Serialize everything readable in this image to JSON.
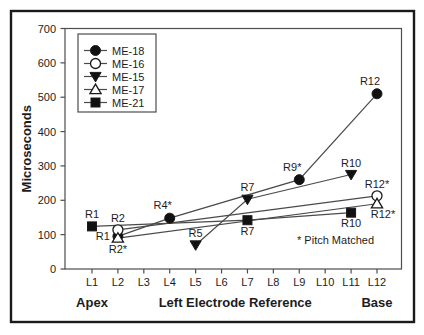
{
  "figure": {
    "background": "#ffffff",
    "frame_color": "#1a1a1a",
    "axis_color": "#4d4d4d",
    "line_color": "#4a4a4a",
    "marker_fill": "#111111",
    "marker_stroke": "#1a1a1a",
    "text_color": "#1c1c1c"
  },
  "chart_data": {
    "type": "line",
    "title": "",
    "xlabel": "Left Electrode Reference",
    "ylabel": "Microseconds",
    "x_axis": {
      "tick_labels": [
        "L1",
        "L2",
        "L3",
        "L4",
        "L5",
        "L6",
        "L7",
        "L8",
        "L9",
        "L10",
        "L11",
        "L12"
      ],
      "left_caption": "Apex",
      "right_caption": "Base"
    },
    "y_axis": {
      "min": 0,
      "max": 700,
      "tick_step": 100,
      "tick_labels": [
        "0",
        "100",
        "200",
        "300",
        "400",
        "500",
        "600",
        "700"
      ]
    },
    "legend": {
      "position": "top-left",
      "items": [
        {
          "label": "ME-18",
          "marker": "filled-circle"
        },
        {
          "label": "ME-16",
          "marker": "open-circle"
        },
        {
          "label": "ME-15",
          "marker": "filled-triangle-down"
        },
        {
          "label": "ME-17",
          "marker": "open-triangle-up"
        },
        {
          "label": "ME-21",
          "marker": "filled-square"
        }
      ]
    },
    "series": [
      {
        "name": "ME-18",
        "marker": "filled-circle",
        "points": [
          {
            "x": 2,
            "y": 95,
            "label": "R1",
            "label_pos": "left"
          },
          {
            "x": 4,
            "y": 148,
            "label": "R4*",
            "label_pos": "above-left"
          },
          {
            "x": 9,
            "y": 260,
            "label": "R9*",
            "label_pos": "above-left"
          },
          {
            "x": 12,
            "y": 510,
            "label": "R12",
            "label_pos": "above-left"
          }
        ]
      },
      {
        "name": "ME-16",
        "marker": "open-circle",
        "points": [
          {
            "x": 2,
            "y": 114,
            "label": "R2",
            "label_pos": "above"
          },
          {
            "x": 12,
            "y": 213,
            "label": "R12*",
            "label_pos": "above"
          }
        ]
      },
      {
        "name": "ME-15",
        "marker": "filled-triangle-down",
        "points": [
          {
            "x": 5,
            "y": 70,
            "label": "R5",
            "label_pos": "above"
          },
          {
            "x": 7,
            "y": 203,
            "label": "R7",
            "label_pos": "above"
          },
          {
            "x": 11,
            "y": 275,
            "label": "R10",
            "label_pos": "above"
          }
        ]
      },
      {
        "name": "ME-17",
        "marker": "open-triangle-up",
        "points": [
          {
            "x": 2,
            "y": 90,
            "label": "R2*",
            "label_pos": "below"
          },
          {
            "x": 12,
            "y": 190,
            "label": "R12*",
            "label_pos": "below-right"
          }
        ]
      },
      {
        "name": "ME-21",
        "marker": "filled-square",
        "points": [
          {
            "x": 1,
            "y": 124,
            "label": "R1",
            "label_pos": "above"
          },
          {
            "x": 7,
            "y": 142,
            "label": "R7",
            "label_pos": "below"
          },
          {
            "x": 11,
            "y": 164,
            "label": "R10",
            "label_pos": "below"
          }
        ]
      }
    ],
    "annotation": {
      "text": "* Pitch Matched",
      "x": 10.4,
      "y": 83
    }
  }
}
